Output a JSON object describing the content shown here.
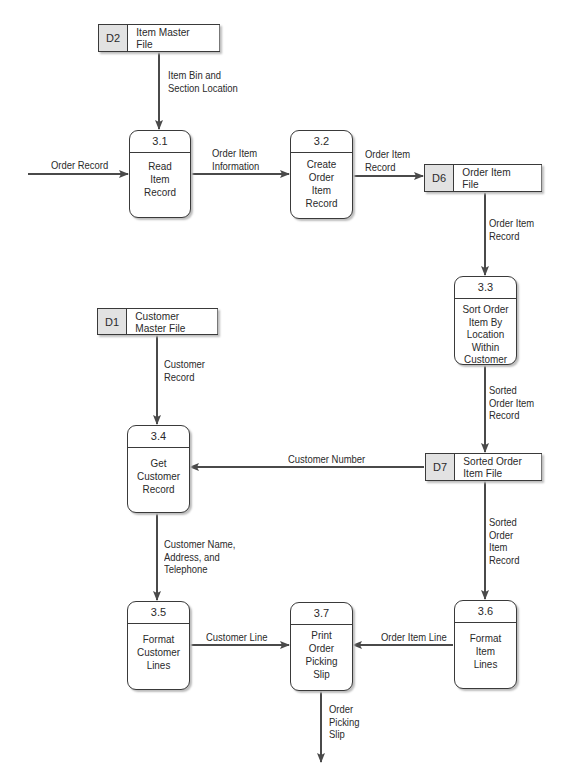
{
  "diagram": {
    "type": "data-flow-diagram",
    "processes": [
      {
        "id": "3.1",
        "name": "Read\nItem\nRecord"
      },
      {
        "id": "3.2",
        "name": "Create\nOrder\nItem\nRecord"
      },
      {
        "id": "3.3",
        "name": "Sort Order\nItem By\nLocation\nWithin\nCustomer"
      },
      {
        "id": "3.4",
        "name": "Get\nCustomer\nRecord"
      },
      {
        "id": "3.5",
        "name": "Format\nCustomer\nLines"
      },
      {
        "id": "3.6",
        "name": "Format\nItem\nLines"
      },
      {
        "id": "3.7",
        "name": "Print\nOrder\nPicking\nSlip"
      }
    ],
    "data_stores": [
      {
        "id": "D2",
        "name": "Item Master\nFile"
      },
      {
        "id": "D6",
        "name": "Order Item\nFile"
      },
      {
        "id": "D1",
        "name": "Customer\nMaster File"
      },
      {
        "id": "D7",
        "name": "Sorted Order\nItem File"
      }
    ],
    "flows": [
      {
        "from": "D2",
        "to": "3.1",
        "label": "Item Bin and\nSection Location"
      },
      {
        "from": "external",
        "to": "3.1",
        "label": "Order Record"
      },
      {
        "from": "3.1",
        "to": "3.2",
        "label": "Order Item\nInformation"
      },
      {
        "from": "3.2",
        "to": "D6",
        "label": "Order Item\nRecord"
      },
      {
        "from": "D6",
        "to": "3.3",
        "label": "Order Item\nRecord"
      },
      {
        "from": "3.3",
        "to": "D7",
        "label": "Sorted\nOrder Item\nRecord"
      },
      {
        "from": "D1",
        "to": "3.4",
        "label": "Customer\nRecord"
      },
      {
        "from": "D7",
        "to": "3.4",
        "label": "Customer Number"
      },
      {
        "from": "3.4",
        "to": "3.5",
        "label": "Customer  Name,\nAddress, and\nTelephone"
      },
      {
        "from": "D7",
        "to": "3.6",
        "label": "Sorted\nOrder\nItem\nRecord"
      },
      {
        "from": "3.5",
        "to": "3.7",
        "label": "Customer Line"
      },
      {
        "from": "3.6",
        "to": "3.7",
        "label": "Order Item Line"
      },
      {
        "from": "3.7",
        "to": "external",
        "label": "Order\nPicking\nSlip"
      }
    ]
  }
}
